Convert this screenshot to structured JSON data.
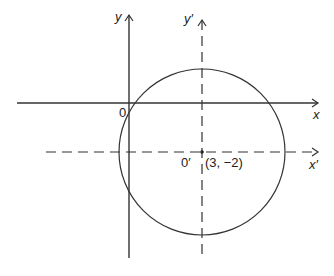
{
  "diagram": {
    "axes": {
      "y_label": "y",
      "x_label": "x",
      "origin_label": "0",
      "y_prime_label": "y′",
      "x_prime_label": "x′",
      "origin_prime_label": "0′",
      "center_coords": "(3, −2)"
    },
    "circle": {
      "center": [
        3,
        -2
      ],
      "description": "circle centered at O′(3, −2)"
    }
  }
}
